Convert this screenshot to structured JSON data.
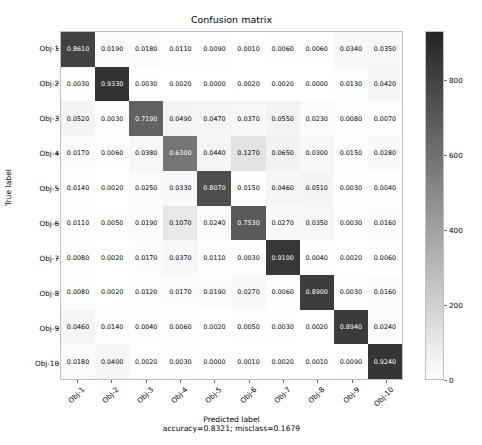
{
  "chart_data": {
    "type": "heatmap",
    "title": "Confusion matrix",
    "xlabel": "Predicted label",
    "xsublabel": "accuracy=0.8321; misclass=0.1679",
    "ylabel": "True label",
    "categories": [
      "Obj-1",
      "Obj-2",
      "Obj-3",
      "Obj-4",
      "Obj-5",
      "Obj-6",
      "Obj-7",
      "Obj-8",
      "Obj-9",
      "Obj-10"
    ],
    "xticklabels": [
      "Obj-1",
      "Obj-2",
      "Obj-3",
      "Obj-4",
      "Obj-5",
      "Obj-6",
      "Obj-7",
      "Obj-8",
      "Obj-9",
      "Obj-10"
    ],
    "yticklabels": [
      "Obj-1",
      "Obj-2",
      "Obj-3",
      "Obj-4",
      "Obj-5",
      "Obj-6",
      "Obj-7",
      "Obj-8",
      "Obj-9",
      "Obj-10"
    ],
    "cell_text_format": "0.0000",
    "grid": false,
    "colormap": "gray_reversed",
    "colorbar": {
      "ticks": [
        0,
        200,
        400,
        600,
        800
      ],
      "tick_labels": [
        "0",
        "200",
        "400",
        "600",
        "800"
      ],
      "vmin": 0,
      "vmax": 930,
      "position": "right",
      "low_color": "#ffffff",
      "high_color": "#242424"
    },
    "values": [
      [
        0.861,
        0.019,
        0.018,
        0.011,
        0.009,
        0.001,
        0.006,
        0.006,
        0.034,
        0.035
      ],
      [
        0.003,
        0.933,
        0.003,
        0.002,
        0.0,
        0.002,
        0.002,
        0.0,
        0.013,
        0.042
      ],
      [
        0.052,
        0.003,
        0.719,
        0.049,
        0.047,
        0.037,
        0.055,
        0.023,
        0.008,
        0.007
      ],
      [
        0.017,
        0.006,
        0.038,
        0.63,
        0.044,
        0.127,
        0.065,
        0.03,
        0.015,
        0.028
      ],
      [
        0.014,
        0.002,
        0.025,
        0.033,
        0.807,
        0.015,
        0.046,
        0.051,
        0.003,
        0.004
      ],
      [
        0.011,
        0.005,
        0.019,
        0.107,
        0.024,
        0.753,
        0.027,
        0.035,
        0.003,
        0.016
      ],
      [
        0.008,
        0.002,
        0.017,
        0.037,
        0.011,
        0.003,
        0.91,
        0.004,
        0.002,
        0.006
      ],
      [
        0.008,
        0.002,
        0.012,
        0.017,
        0.019,
        0.027,
        0.006,
        0.89,
        0.003,
        0.016
      ],
      [
        0.046,
        0.014,
        0.004,
        0.006,
        0.002,
        0.005,
        0.003,
        0.002,
        0.894,
        0.024
      ],
      [
        0.018,
        0.04,
        0.002,
        0.003,
        0.0,
        0.001,
        0.002,
        0.001,
        0.009,
        0.924
      ]
    ],
    "cell_labels": [
      [
        "0.8610",
        "0.0190",
        "0.0180",
        "0.0110",
        "0.0090",
        "0.0010",
        "0.0060",
        "0.0060",
        "0.0340",
        "0.0350"
      ],
      [
        "0.0030",
        "0.9330",
        "0.0030",
        "0.0020",
        "0.0000",
        "0.0020",
        "0.0020",
        "0.0000",
        "0.0130",
        "0.0420"
      ],
      [
        "0.0520",
        "0.0030",
        "0.7190",
        "0.0490",
        "0.0470",
        "0.0370",
        "0.0550",
        "0.0230",
        "0.0080",
        "0.0070"
      ],
      [
        "0.0170",
        "0.0060",
        "0.0380",
        "0.6300",
        "0.0440",
        "0.1270",
        "0.0650",
        "0.0300",
        "0.0150",
        "0.0280"
      ],
      [
        "0.0140",
        "0.0020",
        "0.0250",
        "0.0330",
        "0.8070",
        "0.0150",
        "0.0460",
        "0.0510",
        "0.0030",
        "0.0040"
      ],
      [
        "0.0110",
        "0.0050",
        "0.0190",
        "0.1070",
        "0.0240",
        "0.7530",
        "0.0270",
        "0.0350",
        "0.0030",
        "0.0160"
      ],
      [
        "0.0080",
        "0.0020",
        "0.0170",
        "0.0370",
        "0.0110",
        "0.0030",
        "0.9100",
        "0.0040",
        "0.0020",
        "0.0060"
      ],
      [
        "0.0080",
        "0.0020",
        "0.0120",
        "0.0170",
        "0.0190",
        "0.0270",
        "0.0060",
        "0.8900",
        "0.0030",
        "0.0160"
      ],
      [
        "0.0460",
        "0.0140",
        "0.0040",
        "0.0060",
        "0.0020",
        "0.0050",
        "0.0030",
        "0.0020",
        "0.8940",
        "0.0240"
      ],
      [
        "0.0180",
        "0.0400",
        "0.0020",
        "0.0030",
        "0.0000",
        "0.0010",
        "0.0020",
        "0.0010",
        "0.0090",
        "0.9240"
      ]
    ]
  }
}
